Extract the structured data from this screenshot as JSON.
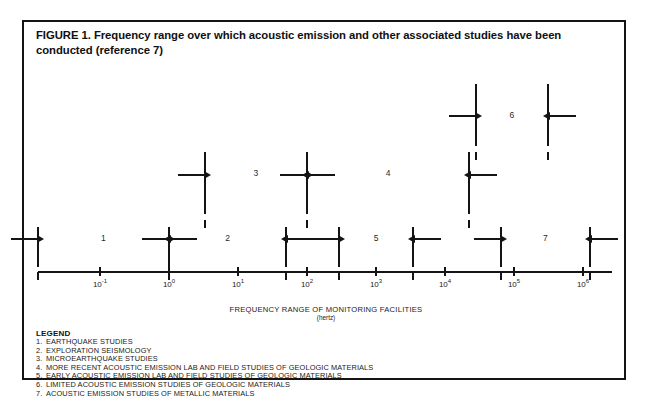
{
  "figure": {
    "title": "FIGURE 1. Frequency range over which acoustic emission and other associated studies have been conducted (reference 7)",
    "xaxis_title": "FREQUENCY RANGE OF MONITORING FACILITIES",
    "xaxis_units": "(hertz)",
    "legend_heading": "LEGEND"
  },
  "chart_data": {
    "type": "range-bar",
    "title": "FIGURE 1. Frequency range over which acoustic emission and other associated studies have been conducted (reference 7)",
    "xlabel": "FREQUENCY RANGE OF MONITORING FACILITIES (hertz)",
    "ylabel": "",
    "x_scale": "log10",
    "xlim": [
      -1.9,
      6.6
    ],
    "grid": false,
    "legend_position": "below-axis",
    "tick_labels": [
      "10⁻¹",
      "10⁰",
      "10¹",
      "10²",
      "10³",
      "10⁴",
      "10⁵",
      "10⁶"
    ],
    "tick_exponents": [
      -1,
      0,
      1,
      2,
      3,
      4,
      5,
      6
    ],
    "series": [
      {
        "id": 1,
        "name": "EARTHQUAKE STUDIES",
        "x_start_exp": -1.9,
        "x_end_exp": 0.0,
        "row": 1,
        "label": "1"
      },
      {
        "id": 2,
        "name": "EXPLORATION SEISMOLOGY",
        "x_start_exp": 0.0,
        "x_end_exp": 1.7,
        "row": 1,
        "label": "2"
      },
      {
        "id": 3,
        "name": "MICROEARTHQUAKE STUDIES",
        "x_start_exp": 0.52,
        "x_end_exp": 2.0,
        "row": 3,
        "label": "3"
      },
      {
        "id": 4,
        "name": "MORE RECENT ACOUSTIC EMISSION LAB AND FIELD STUDIES OF GEOLOGIC MATERIALS",
        "x_start_exp": 2.0,
        "x_end_exp": 4.35,
        "row": 3,
        "label": "4"
      },
      {
        "id": 5,
        "name": "EARLY ACOUSTIC EMISSION LAB AND FIELD STUDIES OF GEOLOGIC MATERIALS",
        "x_start_exp": 2.47,
        "x_end_exp": 3.53,
        "row": 1,
        "label": "5"
      },
      {
        "id": 6,
        "name": "LIMITED ACOUSTIC EMISSION STUDIES OF GEOLOGIC MATERIALS",
        "x_start_exp": 4.45,
        "x_end_exp": 5.49,
        "row": 6,
        "label": "6"
      },
      {
        "id": 7,
        "name": "ACOUSTIC EMISSION STUDIES OF METALLIC MATERIALS",
        "x_start_exp": 4.81,
        "x_end_exp": 6.1,
        "row": 1,
        "label": "7"
      }
    ],
    "legend_entries": [
      {
        "num": "1.",
        "text": "EARTHQUAKE STUDIES"
      },
      {
        "num": "2.",
        "text": "EXPLORATION SEISMOLOGY"
      },
      {
        "num": "3.",
        "text": "MICROEARTHQUAKE STUDIES"
      },
      {
        "num": "4.",
        "text": "MORE RECENT ACOUSTIC EMISSION LAB AND FIELD STUDIES OF GEOLOGIC MATERIALS"
      },
      {
        "num": "5.",
        "text": "EARLY ACOUSTIC EMISSION LAB AND FIELD STUDIES OF GEOLOGIC MATERIALS"
      },
      {
        "num": "6.",
        "text": "LIMITED ACOUSTIC EMISSION STUDIES OF GEOLOGIC MATERIALS"
      },
      {
        "num": "7.",
        "text": "ACOUSTIC EMISSION STUDIES OF METALLIC MATERIALS"
      }
    ]
  },
  "colors": {
    "ink": "#141414",
    "paper": "#ffffff"
  }
}
